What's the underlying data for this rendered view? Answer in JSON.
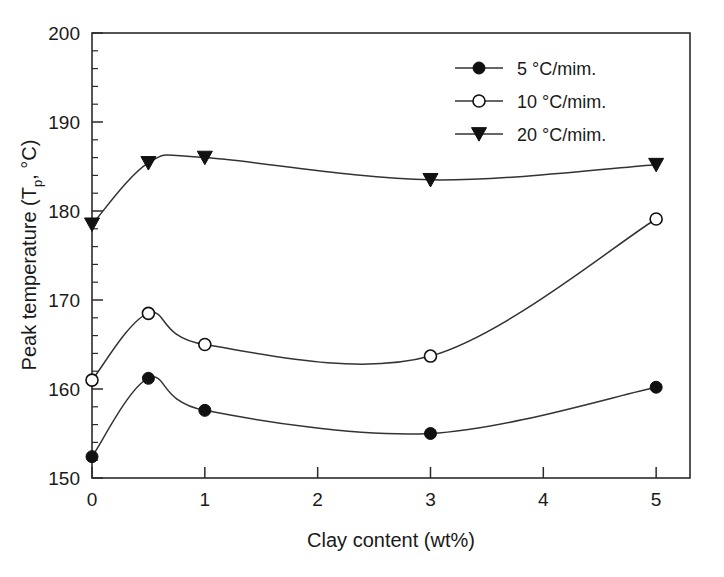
{
  "chart_data": {
    "type": "line",
    "title": "",
    "xlabel": "Clay content (wt%)",
    "ylabel": "Peak temperature (T_p, °C)",
    "ylabel_parts": {
      "prefix": "Peak temperature (T",
      "subscript": "p",
      "suffix": ", °C)"
    },
    "xlim": [
      0,
      5.3
    ],
    "ylim": [
      150,
      200
    ],
    "x_ticks": [
      0,
      1,
      2,
      3,
      4,
      5
    ],
    "x_tick_labels": [
      "0",
      "1",
      "2",
      "3",
      "4",
      "5"
    ],
    "y_ticks": [
      150,
      160,
      170,
      180,
      190,
      200
    ],
    "y_tick_labels": [
      "150",
      "160",
      "170",
      "180",
      "190",
      "200"
    ],
    "y_minor_step": 2,
    "grid": false,
    "legend_position": "top-right",
    "x": [
      0,
      0.5,
      1,
      3,
      5
    ],
    "series": [
      {
        "name": "5 °C/mim.",
        "label_prefix": "5",
        "label_unit": "°C/mim.",
        "marker": "filled-circle",
        "values": [
          152.4,
          161.2,
          157.6,
          155.0,
          160.2
        ]
      },
      {
        "name": "10 °C/mim.",
        "label_prefix": "10",
        "label_unit": "°C/mim.",
        "marker": "open-circle",
        "values": [
          161.0,
          168.5,
          165.0,
          163.7,
          179.1
        ]
      },
      {
        "name": "20 °C/mim.",
        "label_prefix": "20",
        "label_unit": "°C/mim.",
        "marker": "filled-triangle",
        "values": [
          178.5,
          185.4,
          186.0,
          183.5,
          185.2
        ]
      }
    ],
    "colors": {
      "line": "#333333",
      "marker": "#111111",
      "axis": "#2b2b2b",
      "background": "#ffffff",
      "text": "#1a1a1a"
    }
  }
}
